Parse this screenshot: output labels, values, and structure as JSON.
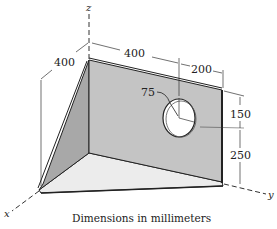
{
  "diagram": {
    "axes": {
      "x": "x",
      "y": "y",
      "z": "z"
    },
    "dimensions": {
      "depth": "400",
      "width_to_hole": "400",
      "hole_to_edge": "200",
      "hole_diameter": "75",
      "top_to_hole": "150",
      "hole_to_bottom": "250"
    },
    "caption": "Dimensions in millimeters",
    "colors": {
      "back_plate": "#c4c4c4",
      "side_plate": "#a8a8a8",
      "base_plate": "#ececec",
      "lines": "#222222"
    }
  }
}
